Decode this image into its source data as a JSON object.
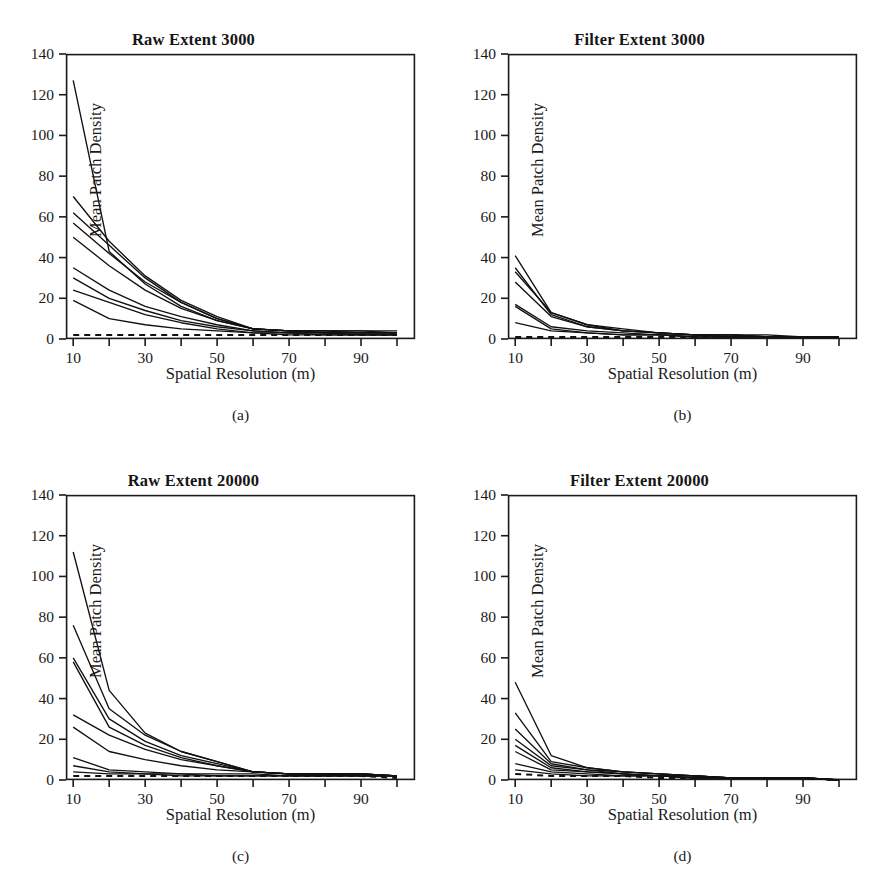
{
  "figure": {
    "panel_count": 4,
    "axis_color": "#1a1a1a",
    "line_color": "#111111",
    "background": "#ffffff"
  },
  "common": {
    "ylabel": "Mean Patch Density",
    "xlabel": "Spatial Resolution (m)",
    "y_ticks": [
      "0",
      "20",
      "40",
      "60",
      "80",
      "100",
      "120",
      "140"
    ],
    "x_ticks": [
      "10",
      "30",
      "50",
      "70",
      "90"
    ]
  },
  "chart_data": [
    {
      "type": "line",
      "panel": "a",
      "caption": "(a)",
      "title": "Raw Extent 3000",
      "xlabel": "Spatial Resolution (m)",
      "ylabel": "Mean Patch Density",
      "xlim": [
        8,
        105
      ],
      "ylim": [
        0,
        140
      ],
      "xtick_values": [
        10,
        20,
        30,
        40,
        50,
        60,
        70,
        80,
        90,
        100
      ],
      "xtick_labeled": [
        10,
        30,
        50,
        70,
        90
      ],
      "ytick_values": [
        0,
        20,
        40,
        60,
        80,
        100,
        120,
        140
      ],
      "grid": false,
      "legend": "none",
      "x": [
        10,
        20,
        30,
        40,
        50,
        60,
        70,
        80,
        90,
        100
      ],
      "series": [
        {
          "name": "s1",
          "style": "solid",
          "values": [
            127,
            43,
            27,
            16,
            9,
            5,
            4,
            4,
            4,
            4
          ]
        },
        {
          "name": "s2",
          "style": "solid",
          "values": [
            70,
            48,
            31,
            19,
            11,
            5,
            4,
            4,
            4,
            3
          ]
        },
        {
          "name": "s3",
          "style": "solid",
          "values": [
            62,
            46,
            30,
            18,
            10,
            5,
            4,
            4,
            3,
            3
          ]
        },
        {
          "name": "s4",
          "style": "solid",
          "values": [
            57,
            42,
            28,
            18,
            10,
            5,
            4,
            3,
            3,
            3
          ]
        },
        {
          "name": "s5",
          "style": "solid",
          "values": [
            50,
            36,
            24,
            15,
            9,
            5,
            4,
            3,
            3,
            3
          ]
        },
        {
          "name": "s6",
          "style": "solid",
          "values": [
            35,
            24,
            16,
            11,
            7,
            4,
            3,
            3,
            3,
            3
          ]
        },
        {
          "name": "s7",
          "style": "solid",
          "values": [
            30,
            20,
            14,
            9,
            6,
            4,
            3,
            3,
            2,
            2
          ]
        },
        {
          "name": "s8",
          "style": "solid",
          "values": [
            24,
            18,
            12,
            8,
            5,
            3,
            3,
            2,
            2,
            2
          ]
        },
        {
          "name": "s9",
          "style": "solid",
          "values": [
            19,
            10,
            7,
            5,
            4,
            3,
            2,
            2,
            2,
            2
          ]
        },
        {
          "name": "s10",
          "style": "dashed",
          "values": [
            2,
            2,
            2,
            2,
            2,
            2,
            2,
            2,
            2,
            2
          ]
        }
      ]
    },
    {
      "type": "line",
      "panel": "b",
      "caption": "(b)",
      "title": "Filter Extent 3000",
      "xlabel": "Spatial Resolution (m)",
      "ylabel": "Mean Patch Density",
      "xlim": [
        8,
        105
      ],
      "ylim": [
        0,
        140
      ],
      "xtick_values": [
        10,
        20,
        30,
        40,
        50,
        60,
        70,
        80,
        90,
        100
      ],
      "xtick_labeled": [
        10,
        30,
        50,
        70,
        90
      ],
      "ytick_values": [
        0,
        20,
        40,
        60,
        80,
        100,
        120,
        140
      ],
      "grid": false,
      "legend": "none",
      "x": [
        10,
        20,
        30,
        40,
        50,
        60,
        70,
        80,
        90,
        100
      ],
      "series": [
        {
          "name": "s1",
          "style": "solid",
          "values": [
            41,
            13,
            7,
            4,
            3,
            2,
            2,
            1,
            1,
            1
          ]
        },
        {
          "name": "s2",
          "style": "solid",
          "values": [
            35,
            12,
            6,
            4,
            3,
            2,
            2,
            1,
            1,
            1
          ]
        },
        {
          "name": "s3",
          "style": "solid",
          "values": [
            33,
            13,
            7,
            5,
            3,
            2,
            2,
            2,
            1,
            1
          ]
        },
        {
          "name": "s4",
          "style": "solid",
          "values": [
            28,
            11,
            6,
            4,
            3,
            2,
            2,
            1,
            1,
            1
          ]
        },
        {
          "name": "s5",
          "style": "solid",
          "values": [
            17,
            6,
            4,
            3,
            2,
            2,
            1,
            1,
            1,
            1
          ]
        },
        {
          "name": "s6",
          "style": "solid",
          "values": [
            16,
            5,
            3,
            2,
            2,
            1,
            1,
            1,
            1,
            1
          ]
        },
        {
          "name": "s7",
          "style": "solid",
          "values": [
            8,
            4,
            3,
            2,
            2,
            1,
            1,
            1,
            1,
            1
          ]
        },
        {
          "name": "s8",
          "style": "dashed",
          "values": [
            1,
            1,
            1,
            1,
            1,
            1,
            1,
            1,
            1,
            1
          ]
        }
      ]
    },
    {
      "type": "line",
      "panel": "c",
      "caption": "(c)",
      "title": "Raw Extent 20000",
      "xlabel": "Spatial Resolution (m)",
      "ylabel": "Mean Patch Density",
      "xlim": [
        8,
        105
      ],
      "ylim": [
        0,
        140
      ],
      "xtick_values": [
        10,
        20,
        30,
        40,
        50,
        60,
        70,
        80,
        90,
        100
      ],
      "xtick_labeled": [
        10,
        30,
        50,
        70,
        90
      ],
      "ytick_values": [
        0,
        20,
        40,
        60,
        80,
        100,
        120,
        140
      ],
      "grid": false,
      "legend": "none",
      "x": [
        10,
        20,
        30,
        40,
        50,
        60,
        70,
        80,
        90,
        100
      ],
      "series": [
        {
          "name": "s1",
          "style": "solid",
          "values": [
            112,
            44,
            23,
            14,
            9,
            4,
            3,
            3,
            3,
            2
          ]
        },
        {
          "name": "s2",
          "style": "solid",
          "values": [
            76,
            35,
            22,
            14,
            9,
            4,
            3,
            3,
            3,
            2
          ]
        },
        {
          "name": "s3",
          "style": "solid",
          "values": [
            60,
            30,
            19,
            12,
            8,
            4,
            3,
            3,
            3,
            2
          ]
        },
        {
          "name": "s4",
          "style": "solid",
          "values": [
            58,
            26,
            17,
            11,
            7,
            4,
            3,
            3,
            3,
            2
          ]
        },
        {
          "name": "s5",
          "style": "solid",
          "values": [
            32,
            22,
            15,
            10,
            7,
            4,
            3,
            3,
            3,
            2
          ]
        },
        {
          "name": "s6",
          "style": "solid",
          "values": [
            26,
            14,
            10,
            7,
            5,
            4,
            3,
            3,
            2,
            2
          ]
        },
        {
          "name": "s7",
          "style": "solid",
          "values": [
            11,
            5,
            4,
            3,
            3,
            3,
            2,
            2,
            2,
            2
          ]
        },
        {
          "name": "s8",
          "style": "solid",
          "values": [
            7,
            4,
            3,
            3,
            2,
            2,
            2,
            2,
            2,
            2
          ]
        },
        {
          "name": "s9",
          "style": "solid",
          "values": [
            4,
            3,
            3,
            2,
            2,
            2,
            2,
            2,
            2,
            2
          ]
        },
        {
          "name": "s10",
          "style": "dashed",
          "values": [
            2,
            2,
            2,
            2,
            2,
            2,
            2,
            2,
            2,
            1
          ]
        }
      ]
    },
    {
      "type": "line",
      "panel": "d",
      "caption": "(d)",
      "title": "Filter Extent 20000",
      "xlabel": "Spatial Resolution (m)",
      "ylabel": "Mean Patch Density",
      "xlim": [
        8,
        105
      ],
      "ylim": [
        0,
        140
      ],
      "xtick_values": [
        10,
        20,
        30,
        40,
        50,
        60,
        70,
        80,
        90,
        100
      ],
      "xtick_labeled": [
        10,
        30,
        50,
        70,
        90
      ],
      "ytick_values": [
        0,
        20,
        40,
        60,
        80,
        100,
        120,
        140
      ],
      "grid": false,
      "legend": "none",
      "x": [
        10,
        20,
        30,
        40,
        50,
        60,
        70,
        80,
        90,
        100
      ],
      "series": [
        {
          "name": "s1",
          "style": "solid",
          "values": [
            48,
            12,
            6,
            4,
            3,
            2,
            1,
            1,
            1,
            0
          ]
        },
        {
          "name": "s2",
          "style": "solid",
          "values": [
            33,
            9,
            6,
            4,
            3,
            2,
            1,
            1,
            1,
            0
          ]
        },
        {
          "name": "s3",
          "style": "solid",
          "values": [
            25,
            8,
            5,
            4,
            3,
            2,
            1,
            1,
            1,
            0
          ]
        },
        {
          "name": "s4",
          "style": "solid",
          "values": [
            20,
            7,
            5,
            3,
            2,
            2,
            1,
            1,
            1,
            0
          ]
        },
        {
          "name": "s5",
          "style": "solid",
          "values": [
            17,
            6,
            4,
            3,
            2,
            2,
            1,
            1,
            1,
            0
          ]
        },
        {
          "name": "s6",
          "style": "solid",
          "values": [
            14,
            5,
            4,
            3,
            2,
            1,
            1,
            1,
            1,
            0
          ]
        },
        {
          "name": "s7",
          "style": "solid",
          "values": [
            8,
            4,
            3,
            2,
            2,
            1,
            1,
            1,
            1,
            0
          ]
        },
        {
          "name": "s8",
          "style": "solid",
          "values": [
            5,
            3,
            2,
            2,
            2,
            1,
            1,
            1,
            1,
            0
          ]
        },
        {
          "name": "s9",
          "style": "dashed",
          "values": [
            3,
            2,
            2,
            2,
            1,
            1,
            1,
            1,
            1,
            0
          ]
        }
      ]
    }
  ]
}
